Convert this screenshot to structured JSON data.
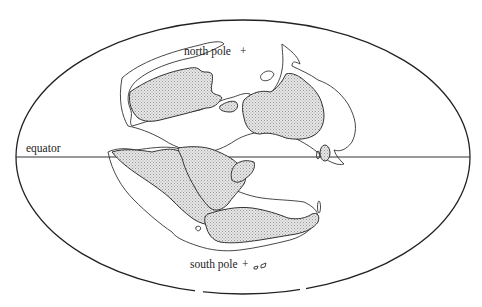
{
  "diagram": {
    "type": "paleogeographic world map (elliptical projection)",
    "labels": {
      "north_pole": "north pole",
      "south_pole": "south pole",
      "equator": "equator",
      "pole_marker": "+"
    },
    "colors": {
      "outline": "#333333",
      "land_fill": "#c8c8c8",
      "background": "#ffffff"
    }
  }
}
